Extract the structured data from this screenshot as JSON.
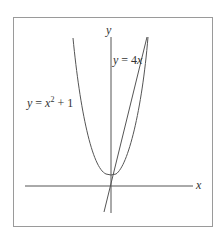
{
  "diagram": {
    "axes": {
      "x_label": "x",
      "y_label": "y"
    },
    "curves": [
      {
        "name": "parabola",
        "equation_label": {
          "lhs": "y",
          "eq": " = ",
          "base": "x",
          "exp": "2",
          "rest": " + 1"
        },
        "formula": "y = x^2 + 1"
      },
      {
        "name": "line",
        "equation_label": {
          "lhs": "y",
          "eq": " = 4",
          "var": "x"
        },
        "formula": "y = 4x"
      }
    ],
    "colors": {
      "stroke": "#555555",
      "frame": "#9a9a9a",
      "text": "#333333",
      "background": "#ffffff"
    }
  }
}
